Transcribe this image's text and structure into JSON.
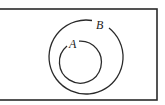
{
  "diagram": {
    "type": "venn",
    "universal_set": {
      "x": -2,
      "y": 9,
      "width": 159,
      "height": 91
    },
    "sets": [
      {
        "label": "B",
        "cx": 86,
        "cy": 57,
        "r": 37,
        "label_x": 96,
        "label_y": 29
      },
      {
        "label": "A",
        "cx": 81,
        "cy": 62,
        "r": 21,
        "label_x": 70,
        "label_y": 48
      }
    ],
    "stroke_color": "#2a2a2a"
  }
}
